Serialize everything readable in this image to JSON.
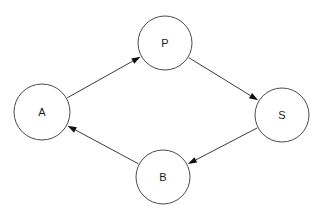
{
  "canvas": {
    "width": 322,
    "height": 223,
    "background": "#ffffff"
  },
  "diagram": {
    "type": "directed-graph",
    "node_style": {
      "shape": "circle",
      "fill": "#ffffff",
      "stroke": "#4a4a4a",
      "stroke_width": 1,
      "label_color": "#1a1a1a",
      "label_size": 11
    },
    "edge_style": {
      "stroke": "#3c3c3c",
      "stroke_width": 1,
      "arrowhead": "filled-triangle",
      "arrowhead_color": "#101010",
      "arrowhead_length": 9,
      "arrowhead_width": 6
    },
    "nodes": [
      {
        "id": "A",
        "label": "A",
        "cx": 42,
        "cy": 112,
        "r": 28
      },
      {
        "id": "P",
        "label": "P",
        "cx": 165,
        "cy": 43,
        "r": 27
      },
      {
        "id": "S",
        "label": "S",
        "cx": 282,
        "cy": 115,
        "r": 27
      },
      {
        "id": "B",
        "label": "B",
        "cx": 163,
        "cy": 177,
        "r": 27
      }
    ],
    "edges": [
      {
        "id": "A-P",
        "from": "A",
        "to": "P",
        "directed": true
      },
      {
        "id": "P-S",
        "from": "P",
        "to": "S",
        "directed": true
      },
      {
        "id": "S-B",
        "from": "S",
        "to": "B",
        "directed": true
      },
      {
        "id": "B-A",
        "from": "B",
        "to": "A",
        "directed": true
      }
    ]
  }
}
